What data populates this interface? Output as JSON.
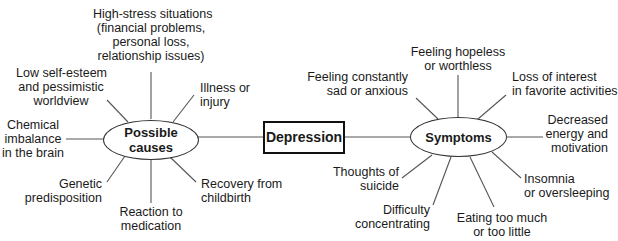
{
  "diagram": {
    "type": "mind-map",
    "center": {
      "label": "Depression"
    },
    "branches": [
      {
        "label": "Possible causes",
        "items": [
          "Chemical imbalance in the brain",
          "Low self-esteem and pessimistic worldview",
          "High-stress situations (financial problems, personal loss, relationship issues)",
          "Illness or injury",
          "Recovery from childbirth",
          "Reaction to medication",
          "Genetic predisposition"
        ],
        "lines": {
          "chemical": [
            "Chemical",
            "imbalance",
            "in the brain"
          ],
          "low_self": [
            "Low self-esteem",
            "and pessimistic",
            "worldview"
          ],
          "high_stress": [
            "High-stress situations",
            "(financial problems,",
            "personal loss,",
            "relationship issues)"
          ],
          "illness": [
            "Illness or",
            "injury"
          ],
          "recovery": [
            "Recovery from",
            "childbirth"
          ],
          "reaction": [
            "Reaction to",
            "medication"
          ],
          "genetic": [
            "Genetic",
            "predisposition"
          ]
        }
      },
      {
        "label": "Symptoms",
        "items": [
          "Feeling constantly sad or anxious",
          "Feeling hopeless or worthless",
          "Loss of interest in favorite activities",
          "Decreased energy and motivation",
          "Insomnia or oversleeping",
          "Eating too much or too little",
          "Difficulty concentrating",
          "Thoughts of suicide"
        ],
        "lines": {
          "sad": [
            "Feeling constantly",
            "sad or anxious"
          ],
          "hopeless": [
            "Feeling hopeless",
            "or worthless"
          ],
          "loss": [
            "Loss of interest",
            "in favorite activities"
          ],
          "energy": [
            "Decreased",
            "energy and",
            "motivation"
          ],
          "insomnia": [
            "Insomnia",
            "or oversleeping"
          ],
          "eating": [
            "Eating too much",
            "or too little"
          ],
          "difficulty": [
            "Difficulty",
            "concentrating"
          ],
          "suicide": [
            "Thoughts of",
            "suicide"
          ]
        }
      }
    ]
  },
  "nodes": {
    "center": "Depression",
    "causes": [
      "Possible",
      "causes"
    ],
    "symptoms": "Symptoms"
  },
  "colors": {
    "line": "#555555",
    "text": "#1a1a1a",
    "background": "#ffffff"
  }
}
